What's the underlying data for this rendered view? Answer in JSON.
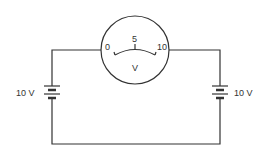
{
  "diagram": {
    "type": "circuit",
    "meter": {
      "unit_label": "V",
      "scale": {
        "min": "0",
        "mid": "5",
        "max": "10"
      }
    },
    "batteries": [
      {
        "label": "10 V",
        "side": "left"
      },
      {
        "label": "10 V",
        "side": "right"
      }
    ],
    "colors": {
      "line": "#333333",
      "background": "#ffffff"
    }
  }
}
